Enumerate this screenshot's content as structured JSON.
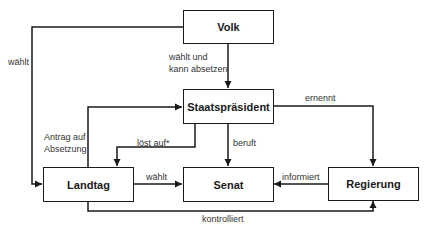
{
  "nodes": {
    "volk": "Volk",
    "staatspraesident": "Staatspräsident",
    "landtag": "Landtag",
    "senat": "Senat",
    "regierung": "Regierung"
  },
  "edges": {
    "volk_landtag": "wählt",
    "volk_staatspraesident_1": "wählt und",
    "volk_staatspraesident_2": "kann absetzen",
    "landtag_staatspraesident_1": "Antrag auf",
    "landtag_staatspraesident_2": "Absetzung",
    "staatspraesident_landtag": "löst auf*",
    "staatspraesident_senat": "beruft",
    "staatspraesident_regierung": "ernennt",
    "landtag_senat": "wählt",
    "regierung_senat": "informiert",
    "landtag_regierung": "kontrolliert"
  },
  "colors": {
    "line": "#1a1a1a",
    "text": "#333333"
  }
}
